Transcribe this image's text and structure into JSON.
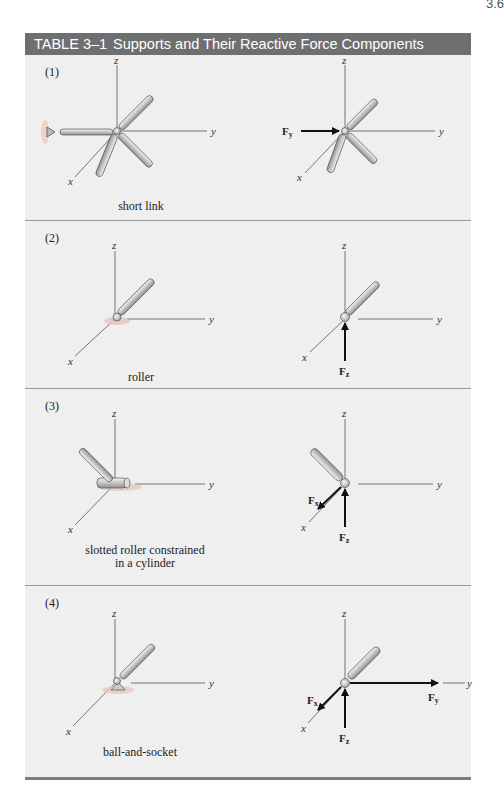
{
  "page": {
    "number_fragment": "3.6"
  },
  "table": {
    "label": "TABLE 3–1",
    "title": "Supports and Their Reactive Force Components",
    "header_color": "#6e6f71",
    "background_color": "#efefef",
    "rows": [
      {
        "index": "(1)",
        "support": "short link",
        "axes": {
          "x": "x",
          "y": "y",
          "z": "z"
        },
        "reactions": [
          {
            "symbol": "F",
            "subscript": "y"
          }
        ],
        "reaction_count": 1
      },
      {
        "index": "(2)",
        "support": "roller",
        "axes": {
          "x": "x",
          "y": "y",
          "z": "z"
        },
        "reactions": [
          {
            "symbol": "F",
            "subscript": "z"
          }
        ],
        "reaction_count": 1
      },
      {
        "index": "(3)",
        "support": "slotted roller constrained in a cylinder",
        "support_line1": "slotted roller constrained",
        "support_line2": "in a cylinder",
        "axes": {
          "x": "x",
          "y": "y",
          "z": "z"
        },
        "reactions": [
          {
            "symbol": "F",
            "subscript": "x"
          },
          {
            "symbol": "F",
            "subscript": "z"
          }
        ],
        "reaction_count": 2
      },
      {
        "index": "(4)",
        "support": "ball-and-socket",
        "axes": {
          "x": "x",
          "y": "y",
          "z": "z"
        },
        "reactions": [
          {
            "symbol": "F",
            "subscript": "x"
          },
          {
            "symbol": "F",
            "subscript": "y"
          },
          {
            "symbol": "F",
            "subscript": "z"
          }
        ],
        "reaction_count": 3
      }
    ]
  }
}
